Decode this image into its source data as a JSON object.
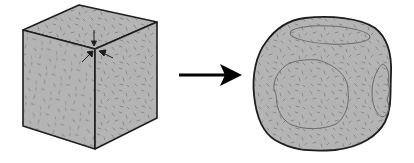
{
  "diagram": {
    "colors": {
      "fill": "#b4b4b4",
      "stroke": "#1e1e1e",
      "texture": "#7d7d7d",
      "facet_outline": "#6a6a6a",
      "arrow": "#000000",
      "background": "#ffffff"
    },
    "left_shape": {
      "type": "cube",
      "vertices": {
        "top_back": [
          79,
          5
        ],
        "top_left": [
          23,
          30
        ],
        "top_right": [
          157,
          22
        ],
        "front_top": [
          95,
          49
        ],
        "bottom_left": [
          23,
          126
        ],
        "bottom_front": [
          95,
          149
        ],
        "bottom_right": [
          157,
          118
        ]
      },
      "corner_arrows": 3
    },
    "transition_arrow": {
      "from": [
        178,
        75
      ],
      "to": [
        240,
        75
      ]
    },
    "right_shape": {
      "type": "rounded-cube",
      "bounds": {
        "left": 254,
        "top": 17,
        "right": 391,
        "bottom": 150
      },
      "facets": [
        "top",
        "front",
        "right"
      ]
    }
  }
}
